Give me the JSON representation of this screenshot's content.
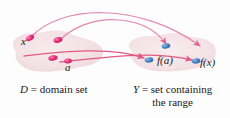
{
  "figure": {
    "background_color": "#fdfdfd"
  },
  "colors": {
    "blob_fill": "#f4e3e6",
    "blob_fill_alt": "#f6e7e9",
    "arrow": "#e0537f",
    "arc_light": "#eb8fae",
    "domain_point": "#e8307a",
    "range_point": "#4a86c8",
    "text": "#1a1a1a"
  },
  "sets": {
    "domain": {
      "name": "D",
      "caption_prefix": "D",
      "caption_equals": " = ",
      "caption_text": "domain set"
    },
    "codomain": {
      "name": "Y",
      "caption_prefix": "Y",
      "caption_equals": " = ",
      "caption_line1": "set containing",
      "caption_line2": "the range"
    }
  },
  "points": {
    "domain_labels": [
      {
        "id": "x",
        "label": "x"
      },
      {
        "id": "a",
        "label": "a"
      }
    ],
    "range_labels": [
      {
        "id": "fa",
        "label": "f(a)"
      },
      {
        "id": "fx",
        "label": "f(x)"
      }
    ]
  },
  "elements": {
    "domain_dot_x": "domain-point-x",
    "domain_dot_upper": "domain-point-upper",
    "domain_dot_left": "domain-point-left",
    "domain_dot_a": "domain-point-a",
    "range_dot_fa": "range-point-fa",
    "range_dot_upper": "range-point-upper",
    "range_dot_fx": "range-point-fx"
  }
}
